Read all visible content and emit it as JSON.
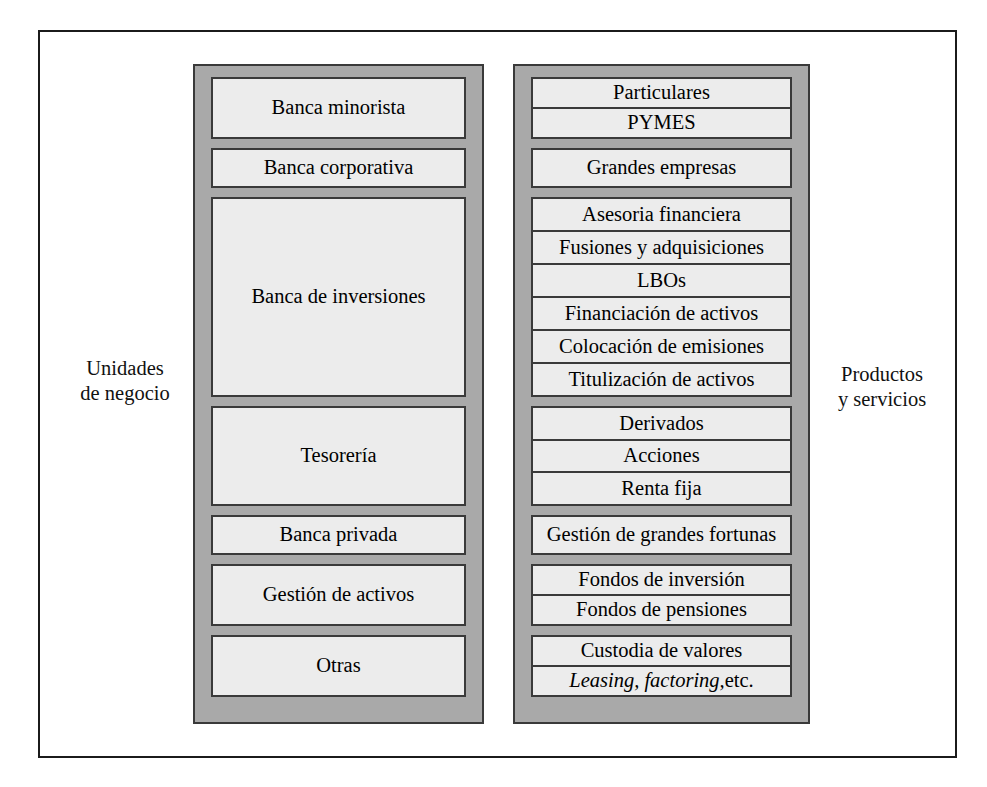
{
  "diagram": {
    "side_labels": {
      "left": "Unidades\nde negocio",
      "left_line1": "Unidades",
      "left_line2": "de negocio",
      "right_line1": "Productos",
      "right_line2": "y servicios"
    },
    "colors": {
      "column_background": "#a9a9a9",
      "box_background": "#ececec",
      "border": "#3a3a3a",
      "frame": "#1b1b1b",
      "text": "#000000"
    },
    "columns": [
      {
        "id": "unidades-de-negocio",
        "label": "Unidades de negocio",
        "groups": [
          {
            "rows": [
              {
                "text": "Banca minorista"
              }
            ]
          },
          {
            "rows": [
              {
                "text": "Banca corporativa"
              }
            ]
          },
          {
            "rows": [
              {
                "text": "Banca de inversiones"
              }
            ]
          },
          {
            "rows": [
              {
                "text": "Tesorería"
              }
            ]
          },
          {
            "rows": [
              {
                "text": "Banca privada"
              }
            ]
          },
          {
            "rows": [
              {
                "text": "Gestión de activos"
              }
            ]
          },
          {
            "rows": [
              {
                "text": "Otras"
              }
            ]
          }
        ]
      },
      {
        "id": "productos-y-servicios",
        "label": "Productos y servicios",
        "groups": [
          {
            "rows": [
              {
                "text": "Particulares"
              },
              {
                "text": "PYMES"
              }
            ]
          },
          {
            "rows": [
              {
                "text": "Grandes empresas"
              }
            ]
          },
          {
            "rows": [
              {
                "text": "Asesoria financiera"
              },
              {
                "text": "Fusiones y adquisiciones"
              },
              {
                "text": "LBOs"
              },
              {
                "text": "Financiación de activos"
              },
              {
                "text": "Colocación de emisiones"
              },
              {
                "text": "Titulización de activos"
              }
            ]
          },
          {
            "rows": [
              {
                "text": "Derivados"
              },
              {
                "text": "Acciones"
              },
              {
                "text": "Renta fija"
              }
            ]
          },
          {
            "rows": [
              {
                "text": "Gestión de grandes fortunas"
              }
            ]
          },
          {
            "rows": [
              {
                "text": "Fondos de inversión"
              },
              {
                "text": "Fondos de pensiones"
              }
            ]
          },
          {
            "rows": [
              {
                "text": "Custodia de valores"
              },
              {
                "text_italic": "Leasing, factoring,",
                "text_tail": " etc."
              }
            ]
          }
        ]
      }
    ]
  }
}
